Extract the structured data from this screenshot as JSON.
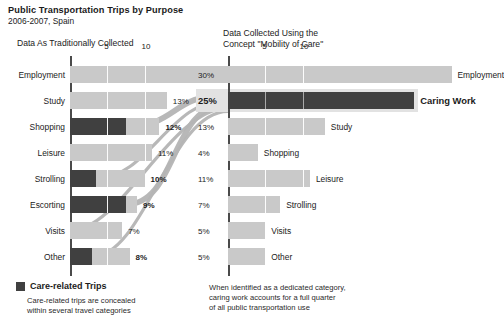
{
  "header": {
    "title": "Public Transportation Trips by Purpose",
    "subtitle": "2006-2007, Spain"
  },
  "left_panel": {
    "heading": "Data As Traditionally Collected"
  },
  "right_panel": {
    "heading": "Data Collected Using the\nConcept \"Mobility of Care\""
  },
  "legend": {
    "swatch_color": "#404040",
    "label": "Care-related Trips",
    "note": "Care-related trips are concealed\nwithin several travel categories"
  },
  "right_note": "When identified as a dedicated category,\ncaring work accounts for a full quarter\nof all public transportation use",
  "colors": {
    "light_bar": "#c9c9c9",
    "dark_bar": "#404040",
    "axis": "#4a4a4a",
    "ribbon": "#b4b4b4",
    "gridline": "#ffffff",
    "highlight_row": "#e2e2e2"
  },
  "chart_data": [
    {
      "type": "bar",
      "id": "traditional",
      "title": "Data As Traditionally Collected",
      "orientation": "horizontal",
      "xlabel": "",
      "ylabel": "",
      "xlim": [
        0,
        15
      ],
      "ticks": [
        5,
        10
      ],
      "grid": true,
      "legend": "Care-related Trips",
      "categories": [
        "Employment",
        "Study",
        "Shopping",
        "Leisure",
        "Strolling",
        "Escorting",
        "Visits",
        "Other"
      ],
      "values": [
        30,
        13,
        12,
        11,
        10,
        9,
        7,
        8
      ],
      "value_labels": [
        "30%",
        "13%",
        "12%",
        "11%",
        "10%",
        "9%",
        "7%",
        "8%"
      ],
      "series": [
        {
          "name": "Care-related portion",
          "values": [
            0,
            0,
            7.5,
            0,
            3.5,
            7.5,
            0,
            3.0
          ]
        },
        {
          "name": "Other portion",
          "values": [
            30,
            13,
            4.5,
            11,
            6.5,
            1.5,
            7,
            5.0
          ]
        }
      ]
    },
    {
      "type": "bar",
      "id": "mobility-of-care",
      "title": "Data Collected Using the Concept \"Mobility of Care\"",
      "orientation": "horizontal",
      "xlabel": "",
      "ylabel": "",
      "xlim": [
        0,
        15
      ],
      "ticks": [
        5,
        10
      ],
      "grid": true,
      "categories": [
        "Employment",
        "Caring Work",
        "Study",
        "Shopping",
        "Leisure",
        "Strolling",
        "Visits",
        "Other"
      ],
      "values": [
        30,
        25,
        13,
        4,
        11,
        7,
        5,
        5
      ],
      "value_labels": [
        "30%",
        "25%",
        "13%",
        "4%",
        "11%",
        "7%",
        "5%",
        "5%"
      ],
      "highlight_category": "Caring Work"
    }
  ],
  "flows": [
    {
      "from": "Shopping",
      "to": "Caring Work",
      "value": 7.5
    },
    {
      "from": "Strolling",
      "to": "Caring Work",
      "value": 3.5
    },
    {
      "from": "Escorting",
      "to": "Caring Work",
      "value": 7.5
    },
    {
      "from": "Visits",
      "to": "Caring Work",
      "value": 2.0
    },
    {
      "from": "Other",
      "to": "Caring Work",
      "value": 3.0
    }
  ],
  "axis": {
    "tick_labels": [
      "5",
      "10"
    ]
  }
}
